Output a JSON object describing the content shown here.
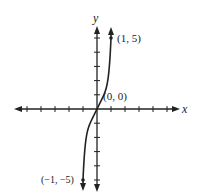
{
  "graph": {
    "axis_labels": {
      "x": "x",
      "y": "y"
    },
    "points": [
      {
        "label": "(1, 5)",
        "x": 1,
        "y": 5
      },
      {
        "label": "(0, 0)",
        "x": 0,
        "y": 0
      },
      {
        "label": "(-1, -5)",
        "display": "(−1, −5)",
        "x": -1,
        "y": -5
      }
    ],
    "x_ticks": [
      -5,
      -4,
      -3,
      -2,
      -1,
      1,
      2,
      3,
      4,
      5
    ],
    "y_ticks": [
      -5,
      -4,
      -3,
      -2,
      -1,
      1,
      2,
      3,
      4,
      5
    ],
    "colors": {
      "ink": "#222222",
      "background": "#ffffff"
    }
  }
}
